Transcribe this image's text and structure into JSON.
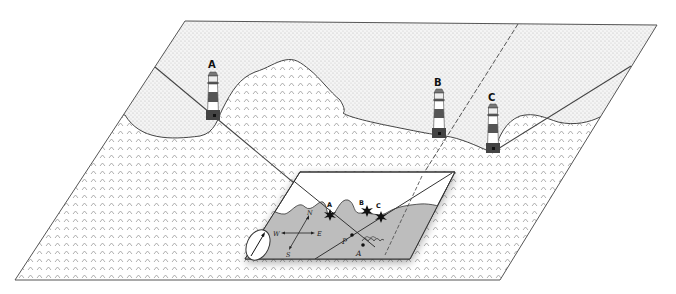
{
  "diagram": {
    "type": "coastal-navigation-bearings",
    "lighthouses": [
      {
        "id": "A",
        "label": "A"
      },
      {
        "id": "B",
        "label": "B"
      },
      {
        "id": "C",
        "label": "C"
      }
    ],
    "inset_chart": {
      "landmarks": [
        {
          "id": "A",
          "label": "A"
        },
        {
          "id": "B",
          "label": "B"
        },
        {
          "id": "C",
          "label": "C"
        }
      ],
      "position_fix_label": "P",
      "dead_reckoning_label": "A",
      "compass_rose": {
        "north": "N",
        "south": "S",
        "east": "E",
        "west": "W"
      },
      "compass_icon": "compass-needle"
    },
    "colors": {
      "land_dots": "#b8b8b8",
      "sea_waves": "#9a9a9a",
      "inset_sea": "#bdbdbd",
      "inset_land": "#ffffff",
      "lighthouse_stripe": "#555555",
      "lighthouse_base": "#444444",
      "outline": "#333333"
    }
  }
}
